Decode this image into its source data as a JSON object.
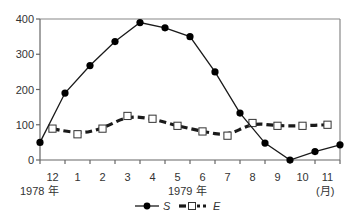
{
  "chart_data": {
    "type": "line",
    "title": "",
    "xlabel": "",
    "ylabel": "",
    "ylim": [
      0,
      400
    ],
    "yticks": [
      0,
      100,
      200,
      300,
      400
    ],
    "grid": false,
    "legend_position": "bottom",
    "categories": [
      "12",
      "1",
      "2",
      "3",
      "4",
      "5",
      "6",
      "7",
      "8",
      "9",
      "10",
      "11"
    ],
    "x_unit_label": "(月)",
    "year_labels": [
      {
        "text": "1978 年",
        "under_category": "12"
      },
      {
        "text": "1979 年",
        "under_category": "5"
      }
    ],
    "series": [
      {
        "name": "S",
        "style": "solid line, filled circle markers",
        "placement": "on tick boundaries (13 points, from start of Dec 1978 to end of Nov 1979)",
        "x": [
          0,
          1,
          2,
          3,
          4,
          5,
          6,
          7,
          8,
          9,
          10,
          11,
          12
        ],
        "values": [
          50,
          190,
          268,
          336,
          390,
          375,
          350,
          250,
          133,
          48,
          0,
          24,
          43
        ]
      },
      {
        "name": "E",
        "style": "thick dashed line, open square markers",
        "placement": "category centers (12 points)",
        "x": [
          0.5,
          1.5,
          2.5,
          3.5,
          4.5,
          5.5,
          6.5,
          7.5,
          8.5,
          9.5,
          10.5,
          11.5
        ],
        "values": [
          89,
          73,
          89,
          125,
          117,
          97,
          81,
          69,
          105,
          97,
          97,
          100
        ]
      }
    ]
  },
  "legend": {
    "s_label": "S",
    "e_label": "E"
  },
  "axis": {
    "y_ticks": [
      "0",
      "100",
      "200",
      "300",
      "400"
    ],
    "x_months": [
      "12",
      "1",
      "2",
      "3",
      "4",
      "5",
      "6",
      "7",
      "8",
      "9",
      "10",
      "11"
    ],
    "year_1978": "1978 年",
    "year_1979": "1979 年",
    "month_unit": "(月)"
  },
  "colors": {
    "line": "#1a1a1a",
    "axis": "#777777",
    "marker_fill_s": "#000000",
    "marker_fill_e": "#ffffff"
  }
}
